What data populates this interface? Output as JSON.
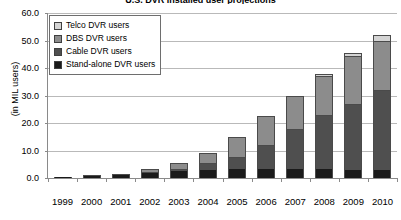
{
  "chart_data": {
    "type": "bar",
    "subtype": "stacked-column",
    "title": "U.S. DVR installed user projections",
    "xlabel": "",
    "ylabel": "(in MIL users)",
    "ylim": [
      0,
      60
    ],
    "ytick_step": 10,
    "ytick_labels": [
      "60.0",
      "50.0",
      "40.0",
      "30.0",
      "20.0",
      "10.0",
      "0.0"
    ],
    "ytick_values": [
      60,
      50,
      40,
      30,
      20,
      10,
      0
    ],
    "grid": true,
    "legend_position": "top-left",
    "categories": [
      "1999",
      "2000",
      "2001",
      "2002",
      "2003",
      "2004",
      "2005",
      "2006",
      "2007",
      "2008",
      "2009",
      "2010"
    ],
    "series": [
      {
        "name": "Stand-alone DVR users",
        "color": "#1a1a1a",
        "values": [
          0.3,
          0.7,
          1.2,
          2.0,
          2.6,
          3.0,
          3.2,
          3.3,
          3.3,
          3.2,
          3.0,
          2.8
        ]
      },
      {
        "name": "Cable DVR users",
        "color": "#4f4f4f",
        "values": [
          0.0,
          0.0,
          0.0,
          0.1,
          0.5,
          2.5,
          4.3,
          8.7,
          14.7,
          19.8,
          24.0,
          29.2
        ]
      },
      {
        "name": "DBS DVR users",
        "color": "#8c8c8c",
        "values": [
          0.0,
          0.1,
          0.3,
          0.9,
          2.2,
          3.5,
          7.5,
          10.5,
          12.0,
          14.0,
          17.5,
          18.0
        ]
      },
      {
        "name": "Telco DVR users",
        "color": "#d4d4d4",
        "values": [
          0.0,
          0.0,
          0.0,
          0.0,
          0.0,
          0.0,
          0.0,
          0.0,
          0.0,
          1.0,
          1.0,
          2.0
        ]
      }
    ],
    "totals": [
      0.3,
      0.8,
      1.5,
      3.0,
      5.3,
      9.0,
      15.0,
      22.5,
      30.0,
      38.0,
      45.5,
      52.0
    ]
  }
}
